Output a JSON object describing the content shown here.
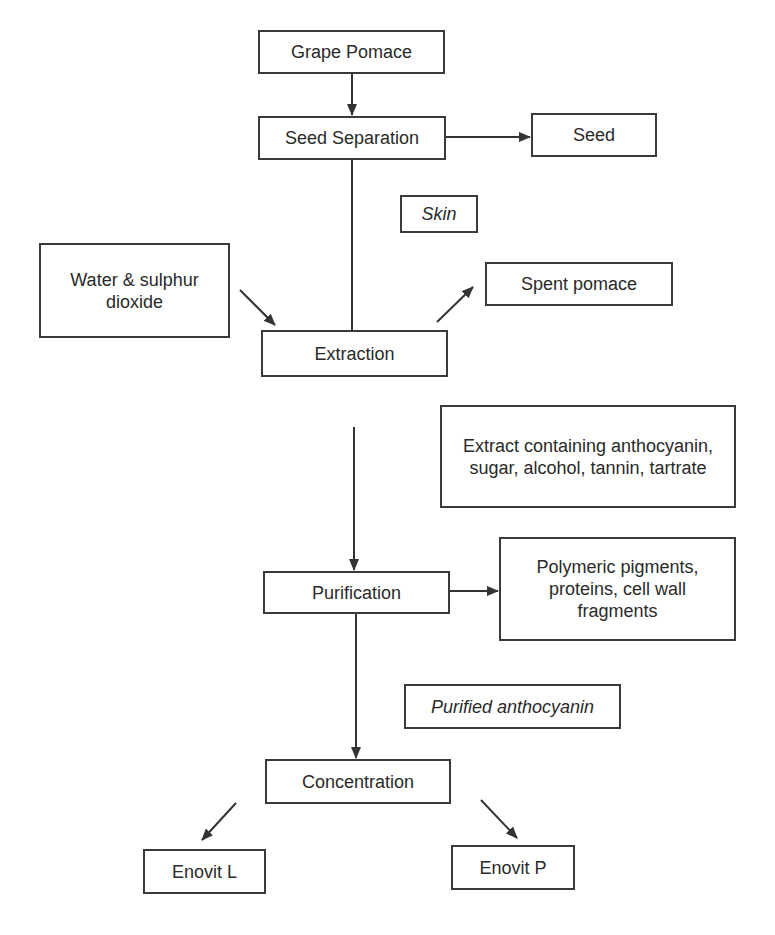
{
  "diagram": {
    "type": "process-flowchart",
    "nodes": {
      "grape_pomace": "Grape Pomace",
      "seed_separation": "Seed Separation",
      "seed": "Seed",
      "skin": "Skin",
      "water_sulphur": "Water & sulphur dioxide",
      "spent_pomace": "Spent pomace",
      "extraction": "Extraction",
      "extract": "Extract containing anthocyanin, sugar, alcohol, tannin, tartrate",
      "purification": "Purification",
      "polymeric": "Polymeric pigments, proteins, cell wall fragments",
      "purified_anthocyanin": "Purified anthocyanin",
      "concentration": "Concentration",
      "enovit_l": "Enovit L",
      "enovit_p": "Enovit P"
    },
    "edges": [
      [
        "Grape Pomace",
        "Seed Separation"
      ],
      [
        "Seed Separation",
        "Seed"
      ],
      [
        "Seed Separation",
        "Extraction"
      ],
      [
        "Water & sulphur dioxide",
        "Extraction"
      ],
      [
        "Extraction",
        "Spent pomace"
      ],
      [
        "Extraction",
        "Purification"
      ],
      [
        "Purification",
        "Polymeric pigments, proteins, cell wall fragments"
      ],
      [
        "Purification",
        "Concentration"
      ],
      [
        "Concentration",
        "Enovit L"
      ],
      [
        "Concentration",
        "Enovit P"
      ]
    ],
    "stream_labels": [
      "Skin",
      "Extract containing anthocyanin, sugar, alcohol, tannin, tartrate",
      "Purified anthocyanin"
    ]
  }
}
